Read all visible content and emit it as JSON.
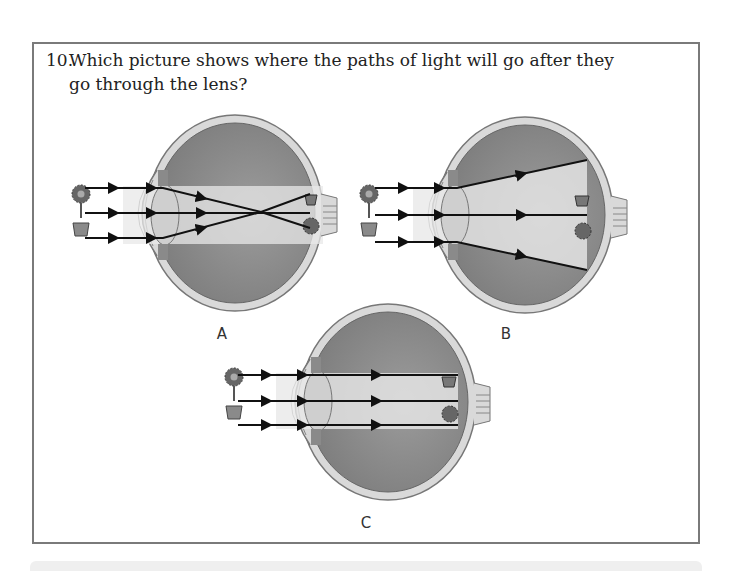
{
  "question": {
    "number": "10.",
    "text": "Which picture shows where the paths of light will go after they go through the lens?"
  },
  "options": [
    {
      "label": "A",
      "description": "Light rays cross behind the lens and form an inverted image on the retina",
      "rays": "converge-crossing"
    },
    {
      "label": "B",
      "description": "Light rays spread apart (diverge) after passing through the lens",
      "rays": "diverging"
    },
    {
      "label": "C",
      "description": "Light rays stay parallel after passing through the lens",
      "rays": "parallel"
    }
  ],
  "colors": {
    "frame_border": "#7a7a7a",
    "eye_fill": "#9a9a9a",
    "eye_sclera": "#d8d8d8",
    "ray": "#111111",
    "beam": "#e6e6e6"
  }
}
